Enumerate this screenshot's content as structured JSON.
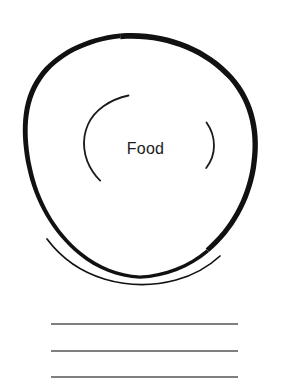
{
  "page": {
    "background_color": "#ffffff",
    "width": 285,
    "height": 384
  },
  "plate": {
    "label": "Food",
    "label_color": "#1a1a1a",
    "outline_color": "#111111",
    "inner_arc_color": "#1a1a1a",
    "center_x": 140,
    "center_y": 156,
    "radius": 117,
    "stroke_min": 1.4,
    "stroke_max": 4.2,
    "rim_arc_present": true,
    "inner_arcs": [
      {
        "name": "left-inner-arc",
        "shape": "c-open-right",
        "top_y": 95,
        "bottom_y": 181
      },
      {
        "name": "right-inner-arc",
        "shape": "paren-open-left",
        "top_y": 122,
        "bottom_y": 168
      }
    ]
  },
  "writing_lines": {
    "color": "#555555",
    "thickness": 1.6,
    "x_start": 51,
    "x_end": 238,
    "items": [
      {
        "name": "writing-line-1",
        "y": 324
      },
      {
        "name": "writing-line-2",
        "y": 351
      },
      {
        "name": "writing-line-3",
        "y": 377
      }
    ]
  }
}
